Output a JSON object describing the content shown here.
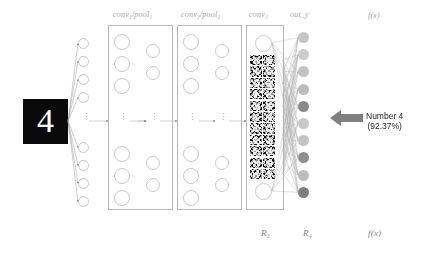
{
  "diagram": {
    "title_hidden": "",
    "layer_labels": [
      {
        "id": "conv1pool1",
        "text": "conv₁/pool₁"
      },
      {
        "id": "conv2pool2",
        "text": "conv₂/pool₂"
      },
      {
        "id": "conv3",
        "text": "conv₃"
      },
      {
        "id": "outy",
        "text": "out_y"
      },
      {
        "id": "fx_top",
        "text": "f(x)"
      }
    ],
    "bottom_labels": [
      {
        "id": "r3",
        "text": "R₃"
      },
      {
        "id": "r4",
        "text": "R₄"
      },
      {
        "id": "fx_bottom",
        "text": "f(x)"
      }
    ],
    "input": {
      "digit": "4",
      "background": "#0a0a0a",
      "stroke_color": "#ffffff"
    },
    "callout": {
      "line1": "Number 4",
      "line2": "(92.37%)",
      "arrow_color": "#808080",
      "arrow_direction": "left"
    },
    "output_nodes": [
      {
        "index": 0,
        "label": "0",
        "color": "#c6c6c6"
      },
      {
        "index": 1,
        "label": "1",
        "color": "#cccccc"
      },
      {
        "index": 2,
        "label": "2",
        "color": "#c2c2c2"
      },
      {
        "index": 3,
        "label": "3",
        "color": "#bcbcbc"
      },
      {
        "index": 4,
        "label": "4",
        "color": "#8a8a8a"
      },
      {
        "index": 5,
        "label": "5",
        "color": "#c9c9c9"
      },
      {
        "index": 6,
        "label": "6",
        "color": "#c4c4c4"
      },
      {
        "index": 7,
        "label": "7",
        "color": "#8f8f8f"
      },
      {
        "index": 8,
        "label": "8",
        "color": "#bdbdbd"
      },
      {
        "index": 9,
        "label": "9",
        "color": "#7e7e7e"
      }
    ],
    "colors": {
      "label_gray": "#a6a6a6",
      "box_border": "#b8b8b8",
      "circle_border": "#c9c9c9",
      "connection_line": "#9a9a9a",
      "callout_text": "#262626"
    },
    "ellipsis": "⋮"
  }
}
